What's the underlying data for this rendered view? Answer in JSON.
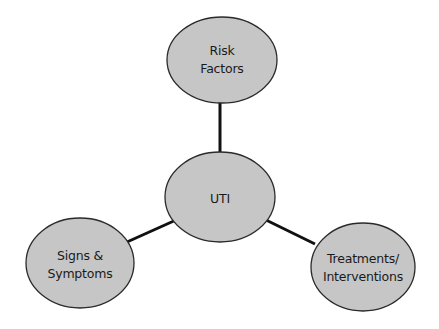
{
  "diagram": {
    "type": "concept-map",
    "colors": {
      "node_fill": "#c6c6c6",
      "node_stroke": "#2a2a2a",
      "connector": "#111111",
      "text": "#1a1a1a",
      "background": "#ffffff"
    },
    "nodes": {
      "center": {
        "label_lines": [
          "UTI"
        ]
      },
      "top": {
        "label_lines": [
          "Risk",
          "Factors"
        ]
      },
      "left": {
        "label_lines": [
          "Signs &",
          "Symptoms"
        ]
      },
      "right": {
        "label_lines": [
          "Treatments/",
          "Interventions"
        ]
      }
    },
    "edges": [
      {
        "from": "center",
        "to": "top"
      },
      {
        "from": "center",
        "to": "left"
      },
      {
        "from": "center",
        "to": "right"
      }
    ]
  }
}
